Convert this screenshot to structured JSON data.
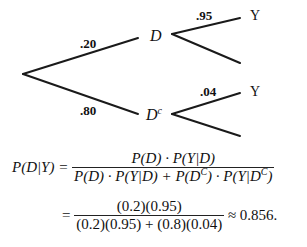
{
  "tree": {
    "branches": {
      "to_D": {
        "prob": ".20"
      },
      "to_Dc": {
        "prob": ".80"
      },
      "D_to_Y": {
        "prob": ".95"
      },
      "Dc_to_Y": {
        "prob": ".04"
      }
    },
    "nodes": {
      "D": "D",
      "Dc_base": "D",
      "Dc_sup": "c",
      "Y_top": "Y",
      "Y_bottom": "Y"
    }
  },
  "formula": {
    "lhs": "P(D|Y) =",
    "line1": {
      "numerator": "P(D) · P(Y|D)",
      "denominator_part1": "P(D) · P(Y|D) + P(D",
      "denominator_sup1": "C",
      "denominator_part2": ") · P(Y|D",
      "denominator_sup2": "C",
      "denominator_part3": ")"
    },
    "line2": {
      "equals": "=",
      "numerator": "(0.2)(0.95)",
      "denominator": "(0.2)(0.95) + (0.8)(0.04)",
      "result": "≈ 0.856."
    }
  }
}
